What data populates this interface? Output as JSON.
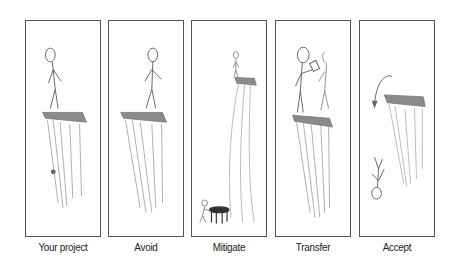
{
  "panels": [
    {
      "label": "Your project",
      "scene": "stick figure standing on cliff edge"
    },
    {
      "label": "Avoid",
      "scene": "stick figure walking away from cliff edge"
    },
    {
      "label": "Mitigate",
      "scene": "stick figure on tall cliff with trampoline placed at the bottom"
    },
    {
      "label": "Transfer",
      "scene": "stick figure handing a document to another figure on cliff"
    },
    {
      "label": "Accept",
      "scene": "stick figure falling upside down from cliff"
    }
  ],
  "colors": {
    "border": "#555555",
    "ink": "#666666",
    "cliff": "#8a8a8a"
  }
}
